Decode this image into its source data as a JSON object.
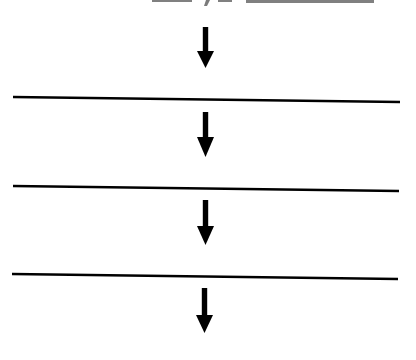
{
  "diagram": {
    "type": "flow",
    "direction": "top-to-bottom",
    "colors": {
      "background": "#ffffff",
      "ink": "#000000"
    },
    "header_fragment": {
      "visible": true,
      "clipped": true,
      "text": ""
    },
    "arrows": [
      {
        "id": "arrow-1",
        "x": 205.5,
        "shaft_top": 27,
        "shaft_bottom": 51,
        "head_bottom": 68
      },
      {
        "id": "arrow-2",
        "x": 205.5,
        "shaft_top": 112,
        "shaft_bottom": 137,
        "head_bottom": 157
      },
      {
        "id": "arrow-3",
        "x": 205.5,
        "shaft_top": 200,
        "shaft_bottom": 226,
        "head_bottom": 245
      },
      {
        "id": "arrow-4",
        "x": 204.5,
        "shaft_top": 288,
        "shaft_bottom": 315,
        "head_bottom": 333
      }
    ],
    "dividers": [
      {
        "id": "divider-1",
        "x1": 13,
        "y1": 97,
        "x2": 400,
        "y2": 102
      },
      {
        "id": "divider-2",
        "x1": 13,
        "y1": 186,
        "x2": 399,
        "y2": 191
      },
      {
        "id": "divider-3",
        "x1": 12,
        "y1": 274,
        "x2": 398,
        "y2": 279
      }
    ]
  }
}
